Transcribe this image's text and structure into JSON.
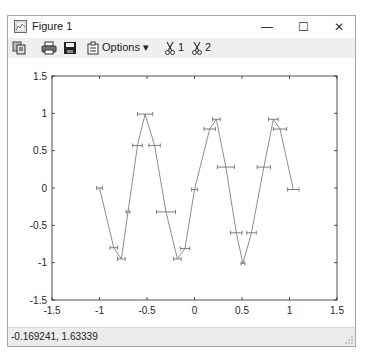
{
  "window": {
    "title": "Figure 1",
    "controls": {
      "minimize": "—",
      "maximize": "☐",
      "close": "✕"
    }
  },
  "toolbar": {
    "icons": [
      "copy-icon",
      "print-icon",
      "save-icon",
      "options-icon"
    ],
    "options_label": "Options ▾",
    "axes_buttons": [
      {
        "icon": "scissors-icon",
        "label": "1"
      },
      {
        "icon": "scissors-icon",
        "label": "2"
      }
    ]
  },
  "status": {
    "coordinates": "-0.169241,  1.63339"
  },
  "chart_data": {
    "type": "line",
    "title": "",
    "xlabel": "",
    "ylabel": "",
    "xlim": [
      -1.5,
      1.5
    ],
    "ylim": [
      -1.5,
      1.5
    ],
    "xticks": [
      "-1.5",
      "-1",
      "-0.5",
      "0",
      "0.5",
      "1",
      "1.5"
    ],
    "yticks": [
      "1.5",
      "1",
      "0.5",
      "0",
      "-0.5",
      "-1",
      "-1.5"
    ],
    "grid": false,
    "legend": null,
    "line_color": "#808080",
    "errorbar": "horizontal",
    "series": [
      {
        "name": "data",
        "x": [
          -1.0,
          -0.85,
          -0.77,
          -0.7,
          -0.6,
          -0.52,
          -0.42,
          -0.3,
          -0.18,
          -0.1,
          0.0,
          0.16,
          0.23,
          0.33,
          0.44,
          0.51,
          0.6,
          0.73,
          0.83,
          0.9,
          1.04
        ],
        "y": [
          0.0,
          -0.8,
          -0.95,
          -0.32,
          0.57,
          0.99,
          0.57,
          -0.32,
          -0.95,
          -0.81,
          -0.02,
          0.79,
          0.92,
          0.28,
          -0.6,
          -1.01,
          -0.6,
          0.28,
          0.92,
          0.79,
          -0.02
        ],
        "xerr": [
          0.03,
          0.04,
          0.04,
          0.02,
          0.05,
          0.08,
          0.06,
          0.1,
          0.04,
          0.05,
          0.03,
          0.06,
          0.04,
          0.09,
          0.06,
          0.02,
          0.05,
          0.07,
          0.05,
          0.07,
          0.06
        ]
      }
    ]
  }
}
